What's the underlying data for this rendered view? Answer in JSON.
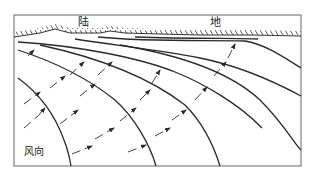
{
  "figure": {
    "labels": {
      "land_char1": "陆",
      "land_char2": "地",
      "wind_direction": "风向"
    },
    "colors": {
      "line": "#2a2a2a",
      "frame": "#555555",
      "background": "#ffffff"
    },
    "frame": {
      "left": 14,
      "top": 15,
      "right": 301,
      "bottom": 166
    },
    "wave_crest_count": 8,
    "ray_count": 3
  }
}
